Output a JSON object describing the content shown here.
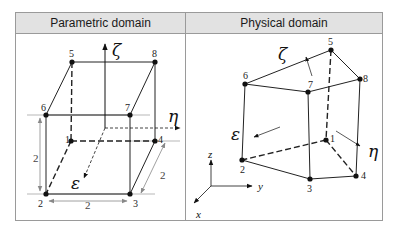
{
  "panels": [
    {
      "title": "Parametric domain",
      "nodes": [
        {
          "id": "1",
          "x": 71,
          "y": 141
        },
        {
          "id": "2",
          "x": 46,
          "y": 194
        },
        {
          "id": "3",
          "x": 130,
          "y": 194
        },
        {
          "id": "4",
          "x": 155,
          "y": 141
        },
        {
          "id": "5",
          "x": 72,
          "y": 62
        },
        {
          "id": "6",
          "x": 46,
          "y": 115
        },
        {
          "id": "7",
          "x": 130,
          "y": 115
        },
        {
          "id": "8",
          "x": 155,
          "y": 62
        }
      ],
      "axes": {
        "zeta": "ζ",
        "eta": "η",
        "epsilon": "ε"
      },
      "dimensions": {
        "height": "2",
        "width": "2",
        "depth": "2"
      }
    },
    {
      "title": "Physical domain",
      "nodes": [
        {
          "id": "1",
          "x": 326,
          "y": 140
        },
        {
          "id": "2",
          "x": 242,
          "y": 160
        },
        {
          "id": "3",
          "x": 310,
          "y": 179
        },
        {
          "id": "4",
          "x": 356,
          "y": 176
        },
        {
          "id": "5",
          "x": 331,
          "y": 50
        },
        {
          "id": "6",
          "x": 245,
          "y": 84
        },
        {
          "id": "7",
          "x": 308,
          "y": 92
        },
        {
          "id": "8",
          "x": 360,
          "y": 79
        }
      ],
      "axes": {
        "zeta": "ζ",
        "eta": "η",
        "epsilon": "ε"
      },
      "global_axes": {
        "x": "x",
        "y": "y",
        "z": "z"
      }
    }
  ]
}
